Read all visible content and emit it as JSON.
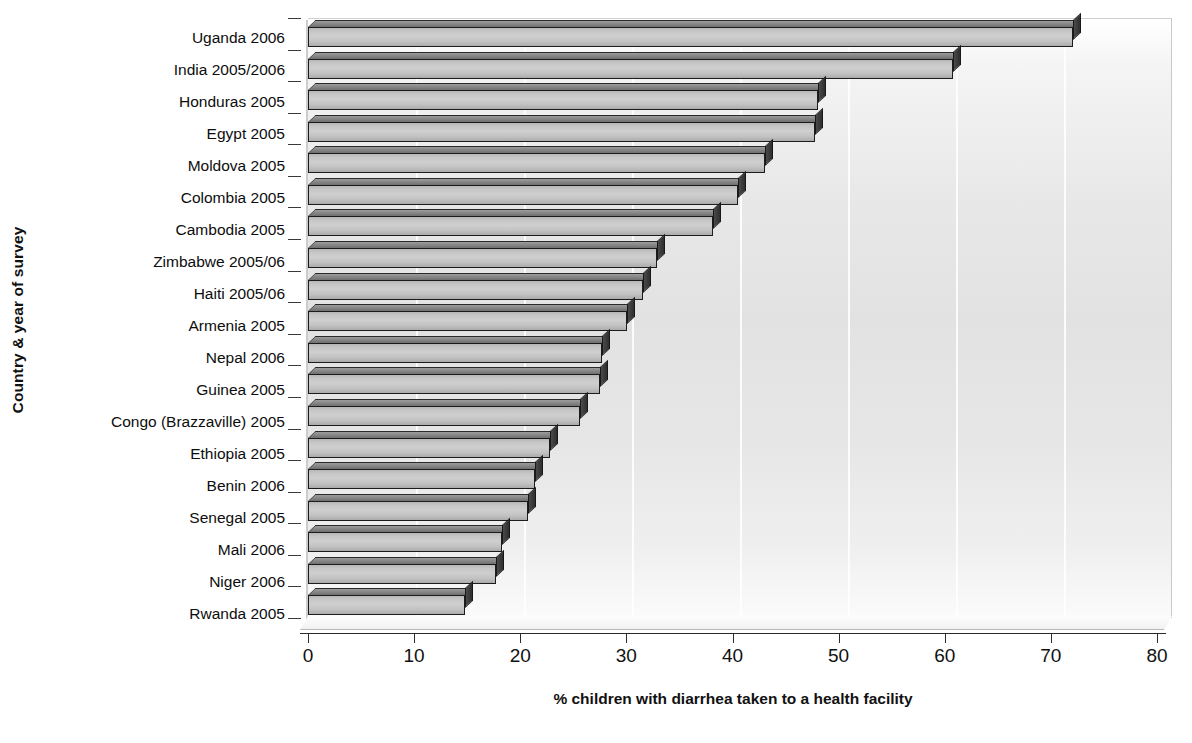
{
  "chart_data": {
    "type": "bar",
    "orientation": "horizontal",
    "title": "",
    "xlabel": "% children with diarrhea taken to a health facility",
    "ylabel": "Country & year of survey",
    "xlim": [
      0,
      80
    ],
    "xticks": [
      0,
      10,
      20,
      30,
      40,
      50,
      60,
      70,
      80
    ],
    "grid": "vertical-faint",
    "legend": "none",
    "categories": [
      "Uganda 2006",
      "India 2005/2006",
      "Honduras 2005",
      "Egypt 2005",
      "Moldova 2005",
      "Colombia 2005",
      "Cambodia 2005",
      "Zimbabwe 2005/06",
      "Haiti 2005/06",
      "Armenia 2005",
      "Nepal 2006",
      "Guinea 2005",
      "Congo (Brazzaville) 2005",
      "Ethiopia 2005",
      "Benin 2006",
      "Senegal 2005",
      "Mali 2006",
      "Niger 2006",
      "Rwanda 2005"
    ],
    "values": [
      70.8,
      59.7,
      47.2,
      46.9,
      42.3,
      39.8,
      37.5,
      32.3,
      31.0,
      29.5,
      27.2,
      27.0,
      25.2,
      22.4,
      21.0,
      20.4,
      18.0,
      17.4,
      14.5
    ]
  },
  "axes": {
    "x_title": "% children with diarrhea taken to a health facility",
    "y_title": "Country & year of survey",
    "x_tick_labels": [
      "0",
      "10",
      "20",
      "30",
      "40",
      "50",
      "60",
      "70",
      "80"
    ]
  },
  "style": {
    "bar_face_color": "#c6c6c6",
    "bar_edge_color": "#1c1c1c",
    "bar_side_color": "#3a3a3a",
    "plot_background": "#e6e6e6",
    "text_color": "#111111"
  }
}
